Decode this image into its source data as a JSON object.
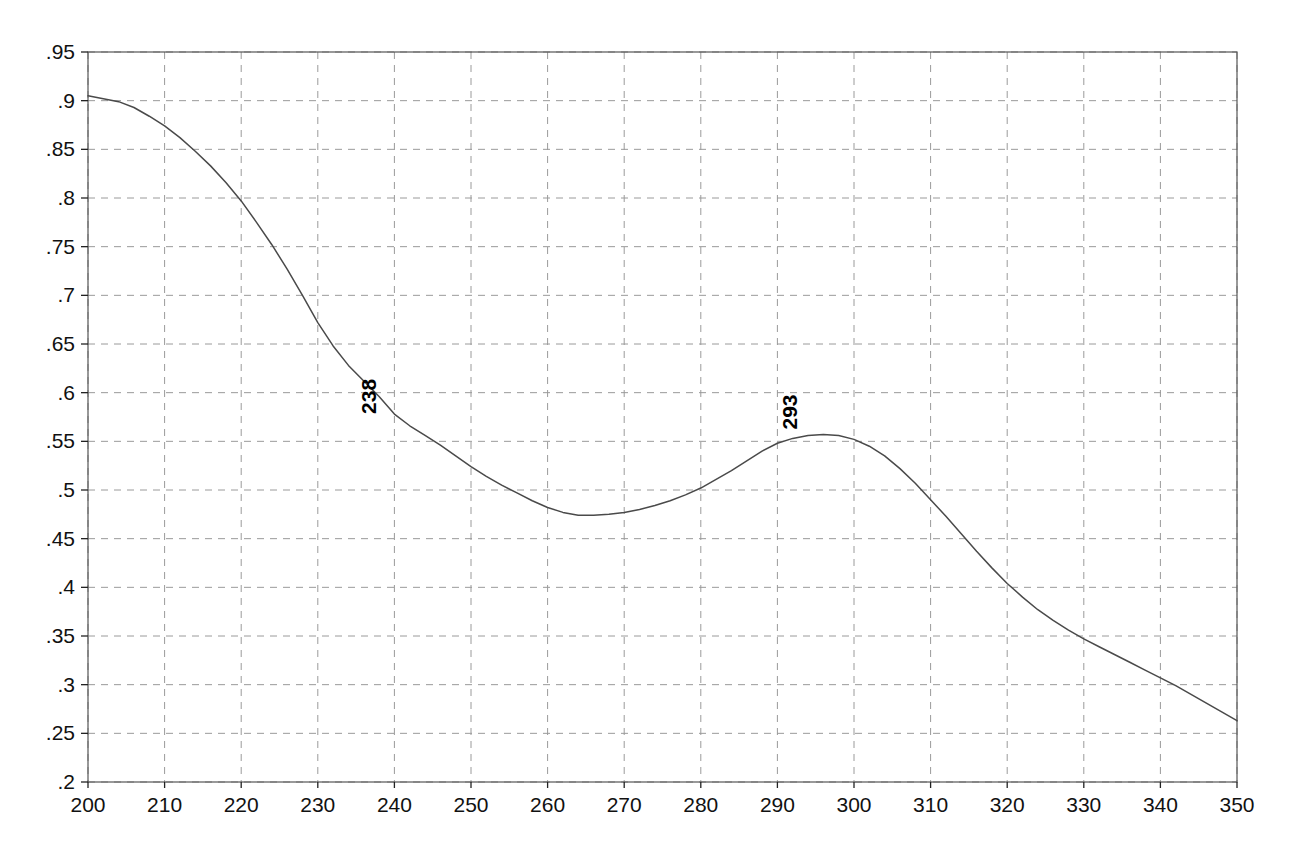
{
  "chart_data": {
    "type": "line",
    "title": "",
    "subtitle": "",
    "xlabel": "",
    "ylabel": "",
    "xlim": [
      200,
      350
    ],
    "ylim": [
      0.2,
      0.95
    ],
    "grid": true,
    "legend": "none",
    "x_ticks": [
      200,
      210,
      220,
      230,
      240,
      250,
      260,
      270,
      280,
      290,
      300,
      310,
      320,
      330,
      340,
      350
    ],
    "x_tick_labels": [
      "200",
      "210",
      "220",
      "230",
      "240",
      "250",
      "260",
      "270",
      "280",
      "290",
      "300",
      "310",
      "320",
      "330",
      "340",
      "350"
    ],
    "y_ticks": [
      0.2,
      0.25,
      0.3,
      0.35,
      0.4,
      0.45,
      0.5,
      0.55,
      0.6,
      0.65,
      0.7,
      0.75,
      0.8,
      0.85,
      0.9,
      0.95
    ],
    "y_tick_labels": [
      ".2",
      ".25",
      ".3",
      ".35",
      ".4",
      ".45",
      ".5",
      ".55",
      ".6",
      ".65",
      ".7",
      ".75",
      ".8",
      ".85",
      ".9",
      ".95"
    ],
    "line_color": "#4a4a4a",
    "grid_color": "#9a9a9a",
    "axis_color": "#555555",
    "background_color": "#ffffff",
    "annotations": [
      {
        "label": "238",
        "x": 238,
        "y": 0.572,
        "rotation": -90
      },
      {
        "label": "293",
        "x": 293,
        "y": 0.556,
        "rotation": -90
      }
    ],
    "series": [
      {
        "name": "spectrum",
        "x": [
          200,
          202,
          204,
          206,
          208,
          210,
          212,
          214,
          216,
          218,
          220,
          222,
          224,
          226,
          228,
          230,
          232,
          234,
          236,
          238,
          240,
          242,
          244,
          246,
          248,
          250,
          252,
          254,
          256,
          258,
          260,
          262,
          264,
          266,
          268,
          270,
          272,
          274,
          276,
          278,
          280,
          282,
          284,
          286,
          288,
          290,
          292,
          294,
          296,
          298,
          300,
          302,
          304,
          306,
          308,
          310,
          312,
          314,
          316,
          318,
          320,
          322,
          324,
          326,
          328,
          330,
          332,
          334,
          336,
          338,
          340,
          342,
          344,
          346,
          348,
          350
        ],
        "values": [
          0.905,
          0.902,
          0.899,
          0.893,
          0.884,
          0.874,
          0.862,
          0.848,
          0.833,
          0.816,
          0.797,
          0.775,
          0.752,
          0.727,
          0.7,
          0.672,
          0.648,
          0.628,
          0.612,
          0.596,
          0.578,
          0.566,
          0.556,
          0.546,
          0.535,
          0.524,
          0.514,
          0.505,
          0.497,
          0.489,
          0.482,
          0.477,
          0.474,
          0.474,
          0.475,
          0.477,
          0.48,
          0.484,
          0.489,
          0.495,
          0.502,
          0.511,
          0.52,
          0.53,
          0.54,
          0.548,
          0.553,
          0.556,
          0.557,
          0.556,
          0.552,
          0.545,
          0.535,
          0.522,
          0.507,
          0.49,
          0.473,
          0.455,
          0.437,
          0.42,
          0.404,
          0.39,
          0.377,
          0.366,
          0.356,
          0.347,
          0.339,
          0.331,
          0.323,
          0.315,
          0.307,
          0.299,
          0.29,
          0.281,
          0.272,
          0.263
        ]
      }
    ]
  },
  "plot": {
    "left_px": 88,
    "top_px": 52,
    "right_px": 1237,
    "bottom_px": 782
  }
}
